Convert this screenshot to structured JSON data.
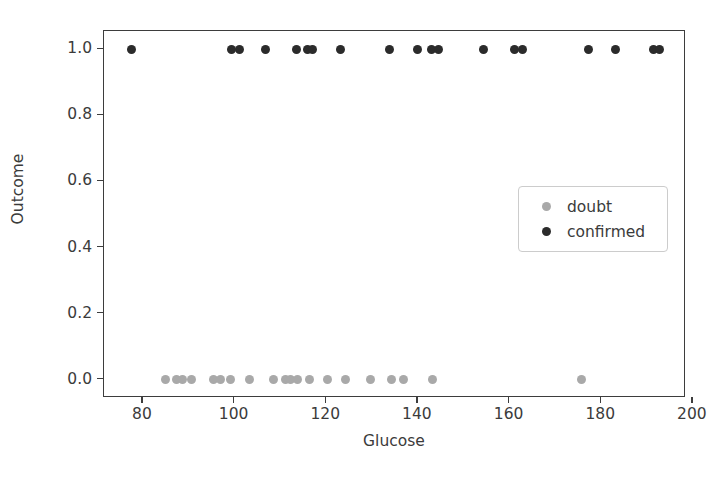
{
  "chart_data": {
    "type": "scatter",
    "title": "",
    "xlabel": "Glucose",
    "ylabel": "Outcome",
    "xlim": [
      71.5,
      198.5
    ],
    "ylim": [
      -0.055,
      1.055
    ],
    "grid": false,
    "legend_position": "center right",
    "xticks": [
      80,
      100,
      120,
      140,
      160,
      180,
      200
    ],
    "xticklabels": [
      "80",
      "100",
      "120",
      "140",
      "160",
      "180",
      "200"
    ],
    "yticks": [
      0.0,
      0.2,
      0.4,
      0.6,
      0.8,
      1.0
    ],
    "yticklabels": [
      "0.0",
      "0.2",
      "0.4",
      "0.6",
      "0.8",
      "1.0"
    ],
    "series": [
      {
        "name": "doubt",
        "color": "#a9a9a9",
        "marker": "circle",
        "x": [
          84.9,
          87.3,
          88.6,
          90.5,
          95.5,
          97.0,
          99.2,
          103.3,
          108.5,
          111.1,
          112.2,
          113.7,
          116.3,
          120.2,
          124.3,
          129.7,
          134.3,
          136.9,
          143.2,
          175.6
        ],
        "y": [
          0,
          0,
          0,
          0,
          0,
          0,
          0,
          0,
          0,
          0,
          0,
          0,
          0,
          0,
          0,
          0,
          0,
          0,
          0,
          0
        ]
      },
      {
        "name": "confirmed",
        "color": "#2b2b2b",
        "marker": "circle",
        "x": [
          77.6,
          99.4,
          101.1,
          106.7,
          113.6,
          115.8,
          117.1,
          123.2,
          133.8,
          139.9,
          142.9,
          144.4,
          154.4,
          161.1,
          162.9,
          177.2,
          183.1,
          191.3,
          192.8
        ],
        "y": [
          1,
          1,
          1,
          1,
          1,
          1,
          1,
          1,
          1,
          1,
          1,
          1,
          1,
          1,
          1,
          1,
          1,
          1,
          1
        ]
      }
    ]
  },
  "legend": {
    "items": [
      {
        "label": "doubt",
        "color": "#a9a9a9"
      },
      {
        "label": "confirmed",
        "color": "#2b2b2b"
      }
    ]
  },
  "axes": {
    "x_title": "Glucose",
    "y_title": "Outcome"
  },
  "colors": {
    "doubt": "#a9a9a9",
    "confirmed": "#2b2b2b",
    "axis": "#3d3d3d",
    "text": "#3b3b3b",
    "background": "#ffffff"
  }
}
